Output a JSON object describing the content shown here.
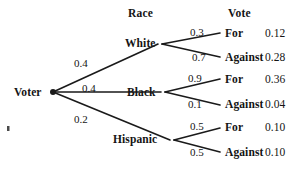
{
  "diagram": {
    "type": "probability-tree",
    "root": {
      "label": "Voter",
      "x": 40,
      "y": 87
    },
    "headers": [
      {
        "name": "race-header",
        "label": "Race",
        "x": 128,
        "y": 8
      },
      {
        "name": "vote-header",
        "label": "Vote",
        "x": 228,
        "y": 8
      }
    ],
    "level1": [
      {
        "id": "white",
        "label": "White",
        "label_x": 125,
        "label_y": 38,
        "node_x": 160,
        "node_y": 44,
        "prob": "0.4",
        "prob_x": 74,
        "prob_y": 58
      },
      {
        "id": "black",
        "label": "Black",
        "label_x": 127,
        "label_y": 87,
        "node_x": 163,
        "node_y": 92,
        "prob": "0.4",
        "prob_x": 82,
        "prob_y": 83
      },
      {
        "id": "hispanic",
        "label": "Hispanic",
        "label_x": 113,
        "label_y": 134,
        "node_x": 172,
        "node_y": 140,
        "prob": "0.2",
        "prob_x": 74,
        "prob_y": 114
      }
    ],
    "level2": [
      {
        "parent": "white",
        "outcome": "For",
        "prob": "0.3",
        "joint": "0.12",
        "prob_x": 190,
        "prob_y": 27,
        "outcome_x": 225,
        "outcome_y": 28,
        "joint_x": 265,
        "joint_y": 28,
        "end_x": 220,
        "end_y": 33
      },
      {
        "parent": "white",
        "outcome": "Against",
        "prob": "0.7",
        "joint": "0.28",
        "prob_x": 192,
        "prob_y": 52,
        "outcome_x": 225,
        "outcome_y": 52,
        "joint_x": 265,
        "joint_y": 52,
        "end_x": 220,
        "end_y": 57
      },
      {
        "parent": "black",
        "outcome": "For",
        "prob": "0.9",
        "joint": "0.36",
        "prob_x": 188,
        "prob_y": 73,
        "outcome_x": 225,
        "outcome_y": 74,
        "joint_x": 265,
        "joint_y": 74,
        "end_x": 220,
        "end_y": 79
      },
      {
        "parent": "black",
        "outcome": "Against",
        "prob": "0.1",
        "joint": "0.04",
        "prob_x": 188,
        "prob_y": 99,
        "outcome_x": 225,
        "outcome_y": 99,
        "joint_x": 265,
        "joint_y": 99,
        "end_x": 220,
        "end_y": 105
      },
      {
        "parent": "hispanic",
        "outcome": "For",
        "prob": "0.5",
        "joint": "0.10",
        "prob_x": 190,
        "prob_y": 121,
        "outcome_x": 225,
        "outcome_y": 122,
        "joint_x": 265,
        "joint_y": 122,
        "end_x": 220,
        "end_y": 128
      },
      {
        "parent": "hispanic",
        "outcome": "Against",
        "prob": "0.5",
        "joint": "0.10",
        "prob_x": 190,
        "prob_y": 147,
        "outcome_x": 225,
        "outcome_y": 147,
        "joint_x": 265,
        "joint_y": 147,
        "end_x": 220,
        "end_y": 152
      }
    ],
    "colors": {
      "background": "#ffffff",
      "ink": "#141414",
      "line": "#1a1a1a"
    },
    "artifact": {
      "x": 7,
      "y": 126,
      "w": 2.5,
      "h": 5
    }
  }
}
